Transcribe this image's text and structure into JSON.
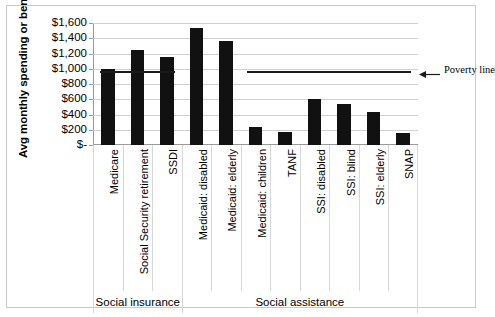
{
  "chart_data": {
    "type": "bar",
    "title": "",
    "xlabel": "",
    "ylabel": "Avg monthly spending or benefit",
    "ylim": [
      0,
      1600
    ],
    "ytick_labels": [
      "$1,600",
      "$1,400",
      "$1,200",
      "$1,000",
      "$800",
      "$600",
      "$400",
      "$200",
      "$-"
    ],
    "ytick_values": [
      1600,
      1400,
      1200,
      1000,
      800,
      600,
      400,
      200,
      0
    ],
    "grid": true,
    "legend": "none",
    "bar_color": "#111111",
    "categories": [
      "Medicare",
      "Social Security retirement",
      "SSDI",
      "Medicaid: disabled",
      "Medicaid: elderly",
      "Medicaid: children",
      "TANF",
      "SSI: disabled",
      "SSI: blind",
      "SSI: elderly",
      "SNAP"
    ],
    "values": [
      1000,
      1250,
      1150,
      1530,
      1360,
      240,
      170,
      600,
      540,
      430,
      160
    ],
    "groups": [
      {
        "label": "Social insurance",
        "categories": [
          "Medicare",
          "Social Security retirement",
          "SSDI"
        ]
      },
      {
        "label": "Social assistance",
        "categories": [
          "Medicaid: disabled",
          "Medicaid: elderly",
          "Medicaid: children",
          "TANF",
          "SSI: disabled",
          "SSI: blind",
          "SSI: elderly",
          "SNAP"
        ]
      }
    ],
    "annotations": [
      {
        "name": "poverty-line",
        "label": "Poverty line",
        "value": 970,
        "segments": [
          [
            0,
            3
          ],
          [
            5,
            11
          ]
        ]
      }
    ]
  }
}
